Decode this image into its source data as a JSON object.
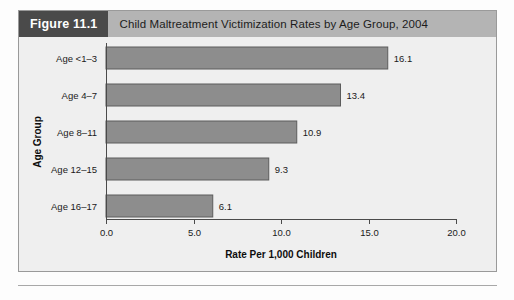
{
  "figure": {
    "tag": "Figure 11.1",
    "title": "Child Maltreatment Victimization Rates by Age Group, 2004"
  },
  "colors": {
    "bar_fill": "#8d8d8d",
    "bar_stroke": "#5c5c5c",
    "header_band": "#b4b4b4",
    "tag_background": "#4a4a4a",
    "plot_background": "#efefef",
    "axis": "#4a4a4a"
  },
  "chart_data": {
    "type": "bar",
    "orientation": "horizontal",
    "title": "Child Maltreatment Victimization Rates by Age Group, 2004",
    "categories": [
      "Age <1–3",
      "Age 4–7",
      "Age 8–11",
      "Age 12–15",
      "Age 16–17"
    ],
    "values": [
      16.1,
      13.4,
      10.9,
      9.3,
      6.1
    ],
    "value_labels": [
      "16.1",
      "13.4",
      "10.9",
      "9.3",
      "6.1"
    ],
    "xlabel": "Rate Per 1,000 Children",
    "ylabel": "Age Group",
    "xlim": [
      0.0,
      20.0
    ],
    "xticks": [
      0.0,
      5.0,
      10.0,
      15.0,
      20.0
    ],
    "xtick_labels": [
      "0.0",
      "5.0",
      "10.0",
      "15.0",
      "20.0"
    ],
    "grid": false,
    "legend": false
  }
}
